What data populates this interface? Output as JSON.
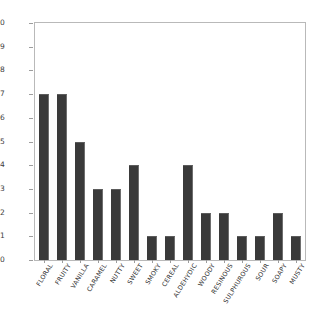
{
  "chart_data": {
    "type": "bar",
    "title": "",
    "subtitle": "",
    "xlabel": "",
    "ylabel": "",
    "ylim": [
      0,
      10
    ],
    "yticks": [
      0,
      1,
      2,
      3,
      4,
      5,
      6,
      7,
      8,
      9,
      10
    ],
    "grid": false,
    "legend": null,
    "bar_color": "#3a3a3a",
    "frame_color": "#b9b9b9",
    "categories": [
      "FLORAL",
      "FRUITY",
      "VANILLA",
      "CARAMEL",
      "NUTTY",
      "SWEET",
      "SMOKY",
      "CEREAL",
      "ALDEHYDIC",
      "WOODY",
      "RESINOUS",
      "SULPHUROUS",
      "SOUR",
      "SOAPY",
      "MUSTY"
    ],
    "values": [
      7,
      7,
      5,
      3,
      3,
      4,
      1,
      1,
      4,
      2,
      2,
      1,
      1,
      2,
      1
    ]
  }
}
